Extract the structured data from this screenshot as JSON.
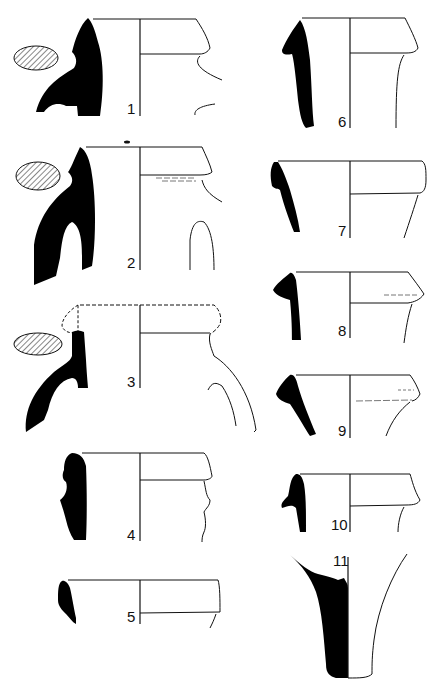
{
  "plate": {
    "type": "archaeological pottery profile drawings",
    "colors": {
      "section_fill": "#000000",
      "outline": "#111111",
      "background": "#ffffff"
    },
    "figures": [
      {
        "id": "1",
        "label": "1",
        "feature": "rim with handle, handle cross-section"
      },
      {
        "id": "2",
        "label": "2",
        "feature": "rim with loop handle, handle cross-section"
      },
      {
        "id": "3",
        "label": "3",
        "feature": "reconstructed rim (dashed) with handle, handle cross-section"
      },
      {
        "id": "4",
        "label": "4",
        "feature": "rim with ridged neck"
      },
      {
        "id": "5",
        "label": "5",
        "feature": "rim"
      },
      {
        "id": "6",
        "label": "6",
        "feature": "rim with neck"
      },
      {
        "id": "7",
        "label": "7",
        "feature": "rim"
      },
      {
        "id": "8",
        "label": "8",
        "feature": "rim"
      },
      {
        "id": "9",
        "label": "9",
        "feature": "rim"
      },
      {
        "id": "10",
        "label": "10",
        "feature": "rim with neck"
      },
      {
        "id": "11",
        "label": "11",
        "feature": "foot / base"
      }
    ]
  }
}
